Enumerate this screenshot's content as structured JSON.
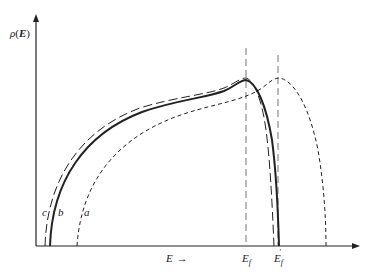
{
  "diagram": {
    "y_axis_label": {
      "rho": "ρ",
      "open": "(",
      "var": "E",
      "close": ")"
    },
    "x_axis_label": {
      "var": "E",
      "arrow": "→"
    },
    "markers": [
      {
        "id": "Ef",
        "base": "E",
        "sub": "f",
        "prime": ""
      },
      {
        "id": "Ef_prime",
        "base": "E",
        "sub": "f",
        "prime": "′"
      }
    ],
    "curves": [
      {
        "id": "c",
        "label": "c",
        "style": "long-dash"
      },
      {
        "id": "b",
        "label": "b",
        "style": "solid"
      },
      {
        "id": "a",
        "label": "a",
        "style": "short-dash"
      }
    ],
    "colors": {
      "ink": "#222222",
      "background": "#ffffff",
      "guide": "#666666"
    }
  }
}
